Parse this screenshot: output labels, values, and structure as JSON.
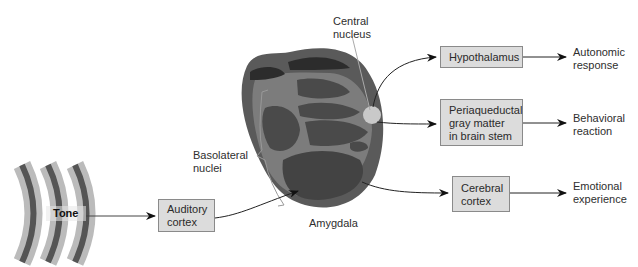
{
  "diagram": {
    "stimulus": {
      "label": "Tone"
    },
    "structure": {
      "label": "Amygdala",
      "parts": {
        "central": "Central\nnucleus",
        "basolateral": "Basolateral\nnuclei"
      }
    },
    "boxes": {
      "auditory": "Auditory\ncortex",
      "hypothalamus": "Hypothalamus",
      "pag": "Periaqueductal\ngray matter\nin brain stem",
      "cerebral": "Cerebral\ncortex"
    },
    "outputs": {
      "autonomic": "Autonomic\nresponse",
      "behavioral": "Behavioral\nreaction",
      "emotional": "Emotional\nexperience"
    },
    "colors": {
      "box_fill": "#dcdcdc",
      "amygdala_outer": "#585858",
      "amygdala_mid": "#7a7a7a",
      "amygdala_nuclei": "#4a4a4a",
      "amygdala_dark": "#2f2f2f",
      "central_nucleus": "#c9c9c9"
    }
  }
}
